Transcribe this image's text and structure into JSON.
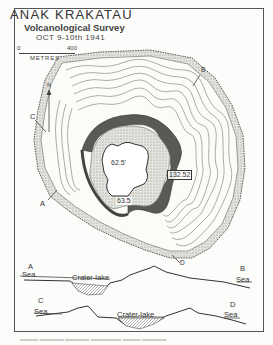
{
  "map": {
    "title": "ANAK KRAKATAU",
    "subtitle": "Volcanological Survey",
    "date": "OCT 9-10th 1941",
    "scale": {
      "start": "0",
      "end": "400",
      "unit": "METRES"
    },
    "north_label": "N",
    "section_markers": [
      "A",
      "B",
      "C",
      "D"
    ],
    "elevations": [
      {
        "label": "62.5'",
        "kind": "lake-level"
      },
      {
        "label": "63.5",
        "kind": "lake-level"
      },
      {
        "label": "132.52",
        "kind": "summit"
      }
    ],
    "colors": {
      "ink": "#333333",
      "paper": "#fcfcfa",
      "stipple": "#b8b8b2",
      "rim_dark": "#4a4a46"
    }
  },
  "sections": [
    {
      "start_marker": "A",
      "end_marker": "B",
      "left_label": "Sea",
      "right_label": "Sea",
      "middle_label": "Crater-lake"
    },
    {
      "start_marker": "C",
      "end_marker": "D",
      "left_label": "Sea",
      "right_label": "Sea",
      "middle_label": "Crater-lake"
    }
  ]
}
